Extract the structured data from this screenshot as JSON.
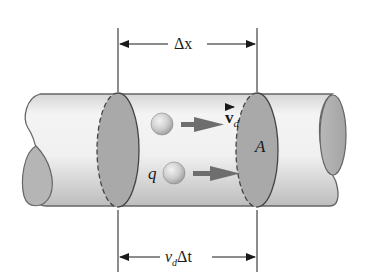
{
  "diagram": {
    "labels": {
      "top_dimension": "Δx",
      "bottom_dimension_v": "v",
      "bottom_dimension_sub": "d",
      "bottom_dimension_rest": "Δt",
      "velocity_vector": "v",
      "velocity_sub": "d",
      "charge": "q",
      "area": "A"
    },
    "colors": {
      "background": "#ffffff",
      "tube_light": "#f4f4f4",
      "tube_shade": "#c8c8c8",
      "cross_section": "#a9a9a9",
      "outline": "#555555",
      "arrow": "#6e6e6e",
      "sphere": "#c4c4c4",
      "text": "#1a1a1a"
    },
    "elements": [
      {
        "name": "conductor-tube",
        "shape": "cylinder"
      },
      {
        "name": "left-cross-section",
        "shape": "ellipse",
        "style": "dashed-left"
      },
      {
        "name": "right-cross-section",
        "shape": "ellipse",
        "style": "dashed-left",
        "label": "A"
      },
      {
        "name": "charge-carrier-upper",
        "shape": "sphere"
      },
      {
        "name": "charge-carrier-lower",
        "shape": "sphere",
        "label": "q"
      },
      {
        "name": "drift-velocity-arrows",
        "count": 2
      }
    ]
  }
}
